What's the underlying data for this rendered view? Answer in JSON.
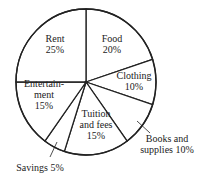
{
  "chart_data": {
    "type": "pie",
    "title": "",
    "start_angle_deg": -90,
    "direction": "clockwise",
    "center": [
      86,
      82
    ],
    "radius": [
      70,
      73
    ],
    "stroke_color": "#222222",
    "fill_color": "#ffffff",
    "slices": [
      {
        "name": "Food",
        "value": 20,
        "label_lines": [
          "Food",
          "20%"
        ],
        "label_pos": [
          112,
          44
        ],
        "inside": true
      },
      {
        "name": "Clothing",
        "value": 10,
        "label_lines": [
          "Clothing",
          "10%"
        ],
        "label_pos": [
          134,
          81
        ],
        "inside": true
      },
      {
        "name": "Books and supplies",
        "value": 10,
        "label_lines": [
          "Books and",
          "supplies 10%"
        ],
        "label_pos": [
          167,
          144
        ],
        "inside": false,
        "leader": [
          [
            137,
            121
          ],
          [
            150,
            133
          ]
        ]
      },
      {
        "name": "Tuition and fees",
        "value": 15,
        "label_lines": [
          "Tuition",
          "and fees",
          "15%"
        ],
        "label_pos": [
          96,
          124
        ],
        "inside": true
      },
      {
        "name": "Savings",
        "value": 5,
        "label_lines": [
          "Savings 5%"
        ],
        "label_pos": [
          40,
          167
        ],
        "inside": false,
        "leader": [
          [
            57,
            142
          ],
          [
            50,
            157
          ]
        ]
      },
      {
        "name": "Entertainment",
        "value": 15,
        "label_lines": [
          "Entertain-",
          "ment",
          "15%"
        ],
        "label_pos": [
          44,
          94
        ],
        "inside": true
      },
      {
        "name": "Rent",
        "value": 25,
        "label_lines": [
          "Rent",
          "25%"
        ],
        "label_pos": [
          55,
          44
        ],
        "inside": true
      }
    ],
    "categories": [
      "Food",
      "Clothing",
      "Books and supplies",
      "Tuition and fees",
      "Savings",
      "Entertainment",
      "Rent"
    ],
    "values": [
      20,
      10,
      10,
      15,
      5,
      15,
      25
    ],
    "units": "%",
    "legend": "none (labels on/next to slices)"
  }
}
